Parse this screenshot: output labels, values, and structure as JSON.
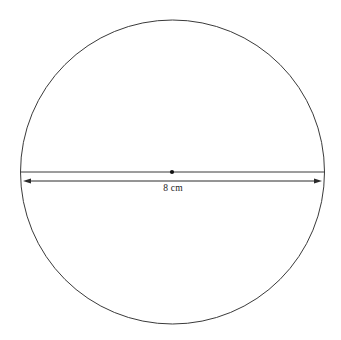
{
  "figure": {
    "kind": "geometry-diagram",
    "background_color": "#ffffff",
    "stroke_color": "#3a3a3a",
    "dimension_stroke_color": "#2b2b2b",
    "text_color": "#1b1b1b",
    "center_dot_color": "#111111"
  },
  "circle": {
    "center_x": 172.5,
    "center_y": 172,
    "radius": 152,
    "stroke_width": 1,
    "fill": "none"
  },
  "center_point": {
    "x": 172,
    "y": 172,
    "radius": 2.1
  },
  "diameter_chord": {
    "x1": 21,
    "y1": 172,
    "x2": 324,
    "y2": 172,
    "stroke_width": 1
  },
  "dimension": {
    "x1": 23,
    "y1": 181,
    "x2": 322,
    "y2": 181,
    "stroke_width": 1,
    "arrowhead": "both",
    "arrowhead_length": 8,
    "arrowhead_width": 5,
    "label": "8 cm",
    "label_x": 173,
    "label_y": 188,
    "value": 8,
    "unit": "cm",
    "measures": "diameter"
  }
}
